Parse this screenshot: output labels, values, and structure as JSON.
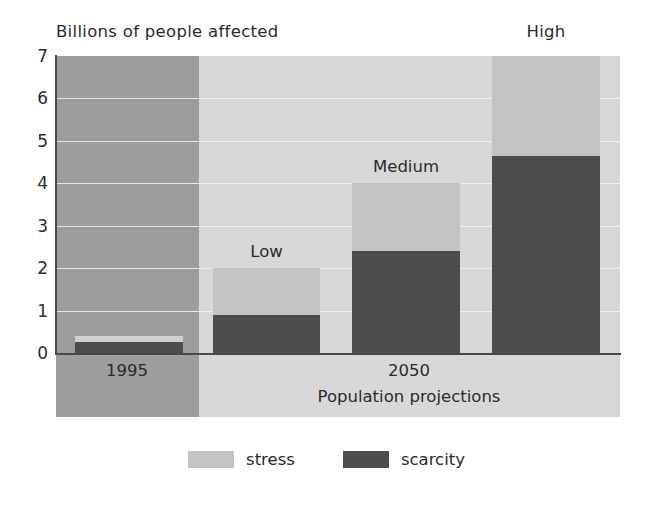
{
  "chart_data": {
    "type": "bar",
    "stacked": true,
    "title": "Billions of people affected",
    "xlabel": "Population projections",
    "ylabel": "",
    "ylim": [
      0,
      7
    ],
    "yticks": [
      "7",
      "6",
      "5",
      "4",
      "3",
      "2",
      "1",
      "0"
    ],
    "grid": true,
    "categories": [
      "1995",
      "Low",
      "Medium",
      "High"
    ],
    "group_labels": [
      "1995",
      "2050"
    ],
    "series": [
      {
        "name": "scarcity",
        "color": "#4d4d4d",
        "values": [
          0.25,
          0.9,
          2.4,
          4.65
        ]
      },
      {
        "name": "stress",
        "color": "#c3c3c3",
        "values": [
          0.15,
          1.1,
          1.6,
          2.35
        ]
      }
    ],
    "cumulative_totals": [
      0.4,
      2.0,
      4.0,
      7.0
    ],
    "legend": {
      "position": "bottom",
      "entries": [
        "stress",
        "scarcity"
      ]
    },
    "annotations": [
      "Low",
      "Medium",
      "High"
    ]
  },
  "chart": {
    "title": "Billions of people affected",
    "axis": {
      "y_ticks": [
        "7",
        "6",
        "5",
        "4",
        "3",
        "2",
        "1",
        "0"
      ],
      "x_caption": "Population projections"
    },
    "groups": [
      {
        "label": "1995"
      },
      {
        "label": "2050"
      }
    ],
    "bars": [
      {
        "name": "1995",
        "label": "",
        "scarcity": 0.25,
        "total": 0.4
      },
      {
        "name": "low",
        "label": "Low",
        "scarcity": 0.9,
        "total": 2.0
      },
      {
        "name": "medium",
        "label": "Medium",
        "scarcity": 2.4,
        "total": 4.0
      },
      {
        "name": "high",
        "label": "High",
        "scarcity": 4.65,
        "total": 7.0
      }
    ],
    "legend": [
      {
        "key": "stress",
        "label": "stress",
        "color": "#c3c3c3"
      },
      {
        "key": "scarcity",
        "label": "scarcity",
        "color": "#4d4d4d"
      }
    ],
    "colors": {
      "band_1995": "#9d9d9d",
      "band_2050": "#d8d8d8",
      "stress": "#c3c3c3",
      "scarcity": "#4d4d4d",
      "axis": "#4a4a4a",
      "gridline": "#f2f2f2",
      "text": "#2b2b2b"
    }
  }
}
